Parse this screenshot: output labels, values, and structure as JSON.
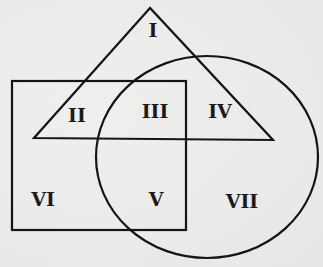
{
  "diagram": {
    "type": "venn",
    "stroke_color": "#141414",
    "background_color": "#ebebea",
    "shapes": {
      "triangle": {
        "points": [
          [
            150,
            8
          ],
          [
            34,
            138
          ],
          [
            273,
            140
          ]
        ]
      },
      "rectangle": {
        "x": 12,
        "y": 81,
        "width": 174,
        "height": 149
      },
      "circle": {
        "cx": 207,
        "cy": 157,
        "rx": 111,
        "ry": 101
      }
    },
    "regions": [
      {
        "id": "I",
        "label": "I",
        "x": 153,
        "y": 30,
        "membership": "triangle only"
      },
      {
        "id": "II",
        "label": "II",
        "x": 77,
        "y": 115,
        "membership": "triangle and rectangle"
      },
      {
        "id": "III",
        "label": "III",
        "x": 155,
        "y": 111,
        "membership": "triangle, rectangle and circle"
      },
      {
        "id": "IV",
        "label": "IV",
        "x": 220,
        "y": 111,
        "membership": "triangle and circle"
      },
      {
        "id": "V",
        "label": "V",
        "x": 156,
        "y": 199,
        "membership": "rectangle and circle"
      },
      {
        "id": "VI",
        "label": "VI",
        "x": 43,
        "y": 199,
        "membership": "rectangle only"
      },
      {
        "id": "VII",
        "label": "VII",
        "x": 242,
        "y": 201,
        "membership": "circle only"
      }
    ]
  }
}
